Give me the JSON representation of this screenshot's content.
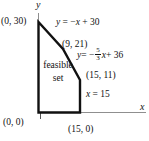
{
  "figure": {
    "colors": {
      "background": "#ffffff",
      "region_stroke": "#111111",
      "axis_stroke": "#8f8f8f",
      "text": "#111111"
    },
    "axes": {
      "x_label": "x",
      "y_label": "y"
    },
    "region": {
      "label_line1": "feasible",
      "label_line2": "set"
    },
    "points": {
      "origin": "(0, 0)",
      "y_intercept": "(0, 30)",
      "corner_mid": "(9, 21)",
      "corner_right": "(15, 11)",
      "x_intercept": "(15, 0)"
    },
    "equations": {
      "line1": {
        "y": "y",
        "mid": " = −",
        "x": "x",
        "rhs": " + 30"
      },
      "line2": {
        "y": "y",
        "mid": " = −",
        "numerator": "5",
        "denominator": "3",
        "x": "x",
        "rhs": " + 36"
      },
      "line3": {
        "x": "x",
        "rhs": " = 15"
      }
    }
  }
}
